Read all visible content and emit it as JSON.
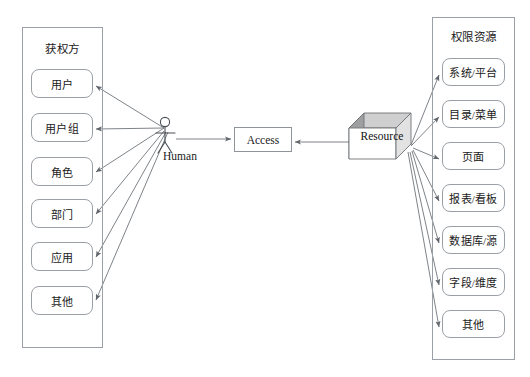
{
  "diagram": {
    "colors": {
      "background": "#ffffff",
      "stroke": "#9aa0a6",
      "arrow": "#6f757b",
      "cube_top": "#c9c9c9",
      "cube_side": "#9e9e9e",
      "cube_front": "#ffffff",
      "text": "#1a1a1a"
    }
  },
  "left_panel": {
    "title": "获权方",
    "items": [
      {
        "label": "用户"
      },
      {
        "label": "用户组"
      },
      {
        "label": "角色"
      },
      {
        "label": "部门"
      },
      {
        "label": "应用"
      },
      {
        "label": "其他"
      }
    ]
  },
  "center": {
    "actor_label": "Human",
    "actor_icon": "stick-figure-icon",
    "access_label": "Access",
    "resource_label": "Resource",
    "resource_icon": "cube-3d-icon"
  },
  "right_panel": {
    "title": "权限资源",
    "items": [
      {
        "label": "系统/平台"
      },
      {
        "label": "目录/菜单"
      },
      {
        "label": "页面"
      },
      {
        "label": "报表/看板"
      },
      {
        "label": "数据库/源"
      },
      {
        "label": "字段/维度"
      },
      {
        "label": "其他"
      }
    ]
  }
}
